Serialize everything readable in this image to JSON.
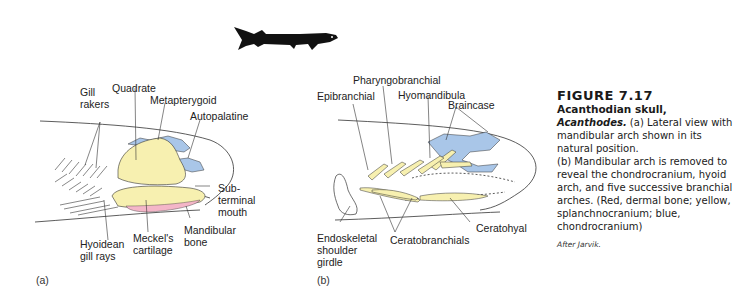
{
  "figure": {
    "number": "FIGURE 7.17",
    "title": "Acanthodian skull,",
    "genus": "Acanthodes.",
    "caption_a": " (a) Lateral view with mandibular arch shown in its natural position.",
    "caption_b": "(b) Mandibular arch is removed to reveal the chondrocranium, hyoid arch, and five successive branchial arches. (Red, dermal bone; yellow, splanchnocranium; blue, chondrocranium)",
    "credit": "After Jarvik."
  },
  "colors": {
    "dermal_bone": "#f4b6c8",
    "splanchnocranium": "#f7f0b0",
    "chondrocranium": "#a9c6e8",
    "outline": "#333333"
  },
  "panel_a": {
    "label": "(a)",
    "labels": {
      "gill_rakers": "Gill\nrakers",
      "quadrate": "Quadrate",
      "metapterygoid": "Metapterygoid",
      "autopalatine": "Autopalatine",
      "subterminal_mouth": "Sub-\nterminal\nmouth",
      "mandibular_bone": "Mandibular\nbone",
      "meckels_cartilage": "Meckel's\ncartilage",
      "hyoidean_gill_rays": "Hyoidean\ngill rays"
    }
  },
  "panel_b": {
    "label": "(b)",
    "labels": {
      "pharyngobranchial": "Pharyngobranchial",
      "epibranchial": "Epibranchial",
      "hyomandibula": "Hyomandibula",
      "braincase": "Braincase",
      "endoskeletal_shoulder_girdle": "Endoskeletal\nshoulder\ngirdle",
      "ceratobranchials": "Ceratobranchials",
      "ceratohyal": "Ceratohyal"
    }
  }
}
